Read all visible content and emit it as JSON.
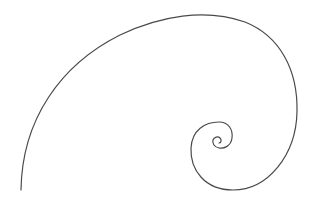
{
  "diagram": {
    "type": "logarithmic-spiral",
    "stroke_color": "#4a4a4a",
    "background_color": "#ffffff",
    "start_point": [
      21,
      190
    ],
    "center_point": [
      219,
      143
    ],
    "bounds": {
      "left": 21,
      "top": 13,
      "right": 297,
      "bottom": 191
    }
  }
}
